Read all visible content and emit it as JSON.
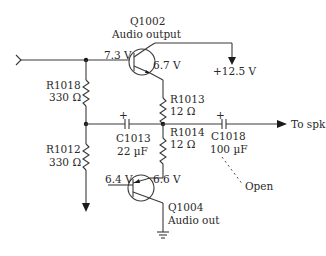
{
  "diagram": {
    "type": "circuit-schematic",
    "colors": {
      "line": "#3a3a3a",
      "text": "#2a2a2a",
      "background": "#ffffff"
    },
    "components": {
      "q1002": {
        "ref": "Q1002",
        "desc": "Audio output",
        "base_voltage": "7.3 V",
        "emitter_voltage": "6.7 V"
      },
      "q1004": {
        "ref": "Q1004",
        "desc": "Audio out",
        "base_voltage": "6.4 V",
        "collector_voltage": "6.6 V"
      },
      "r1018": {
        "ref": "R1018",
        "value": "330 Ω"
      },
      "r1012": {
        "ref": "R1012",
        "value": "330 Ω"
      },
      "r1013": {
        "ref": "R1013",
        "value": "12 Ω"
      },
      "r1014": {
        "ref": "R1014",
        "value": "12 Ω"
      },
      "c1013": {
        "ref": "C1013",
        "value": "22 µF"
      },
      "c1018": {
        "ref": "C1018",
        "value": "100 µF",
        "fault": "Open"
      }
    },
    "labels": {
      "supply": "+12.5 V",
      "output": "To spk",
      "plus": "+"
    }
  }
}
